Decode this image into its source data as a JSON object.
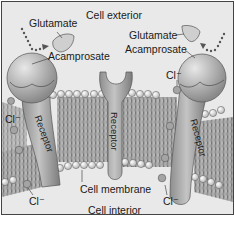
{
  "diagram": {
    "labels": {
      "cell_exterior": "Cell exterior",
      "cell_interior": "Cell interior",
      "cell_membrane": "Cell membrane",
      "glutamate_left": "Glutamate",
      "acamprosate_left": "Acamprosate",
      "glutamate_right": "Glutamate",
      "acamprosate_right": "Acamprosate",
      "receptor_left": "Receptor",
      "receptor_center": "Receptor",
      "receptor_right": "Receptor",
      "chloride_left_top": "Cl⁻",
      "chloride_left_bottom": "Cl⁻",
      "chloride_right_top": "Cl⁻",
      "chloride_right_bottom": "Cl⁻"
    },
    "colors": {
      "background": "#e9e9e9",
      "receptor": "#a8a8a8",
      "lipid_head": "#f2f2f2",
      "membrane_tails": "#8a8a8a",
      "border": "#444444"
    }
  }
}
